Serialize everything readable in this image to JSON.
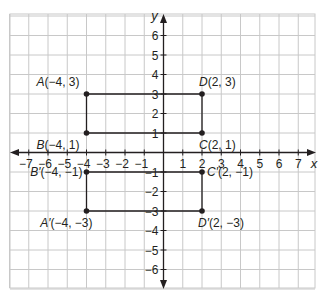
{
  "diagram": {
    "type": "coordinate-plane",
    "x_range": [
      -7,
      7
    ],
    "y_range": [
      -6,
      6
    ],
    "axis_labels": {
      "x": "x",
      "y": "y"
    },
    "x_ticks": [
      "-7",
      "-6",
      "-5",
      "-4",
      "-3",
      "-2",
      "-1",
      "1",
      "2",
      "3",
      "4",
      "5",
      "6",
      "7"
    ],
    "y_ticks": [
      "6",
      "5",
      "4",
      "3",
      "2",
      "1",
      "-1",
      "-2",
      "-3",
      "-4",
      "-5",
      "-6"
    ],
    "colors": {
      "grid": "#c8c8c8",
      "axis": "#231f20",
      "shape": "#231f20",
      "background": "#ffffff"
    },
    "rectangles": [
      {
        "name": "ABCD",
        "points": [
          {
            "id": "A",
            "label": "A(−4, 3)",
            "x": -4,
            "y": 3
          },
          {
            "id": "D",
            "label": "D(2, 3)",
            "x": 2,
            "y": 3
          },
          {
            "id": "C",
            "label": "C(2, 1)",
            "x": 2,
            "y": 1
          },
          {
            "id": "B",
            "label": "B(−4, 1)",
            "x": -4,
            "y": 1
          }
        ]
      },
      {
        "name": "A'B'C'D'",
        "points": [
          {
            "id": "B'",
            "label": "B′(−4, −1)",
            "x": -4,
            "y": -1
          },
          {
            "id": "C'",
            "label": "C′(2, −1)",
            "x": 2,
            "y": -1
          },
          {
            "id": "D'",
            "label": "D′(2, −3)",
            "x": 2,
            "y": -3
          },
          {
            "id": "A'",
            "label": "A′(−4, −3)",
            "x": -4,
            "y": -3
          }
        ]
      }
    ]
  }
}
